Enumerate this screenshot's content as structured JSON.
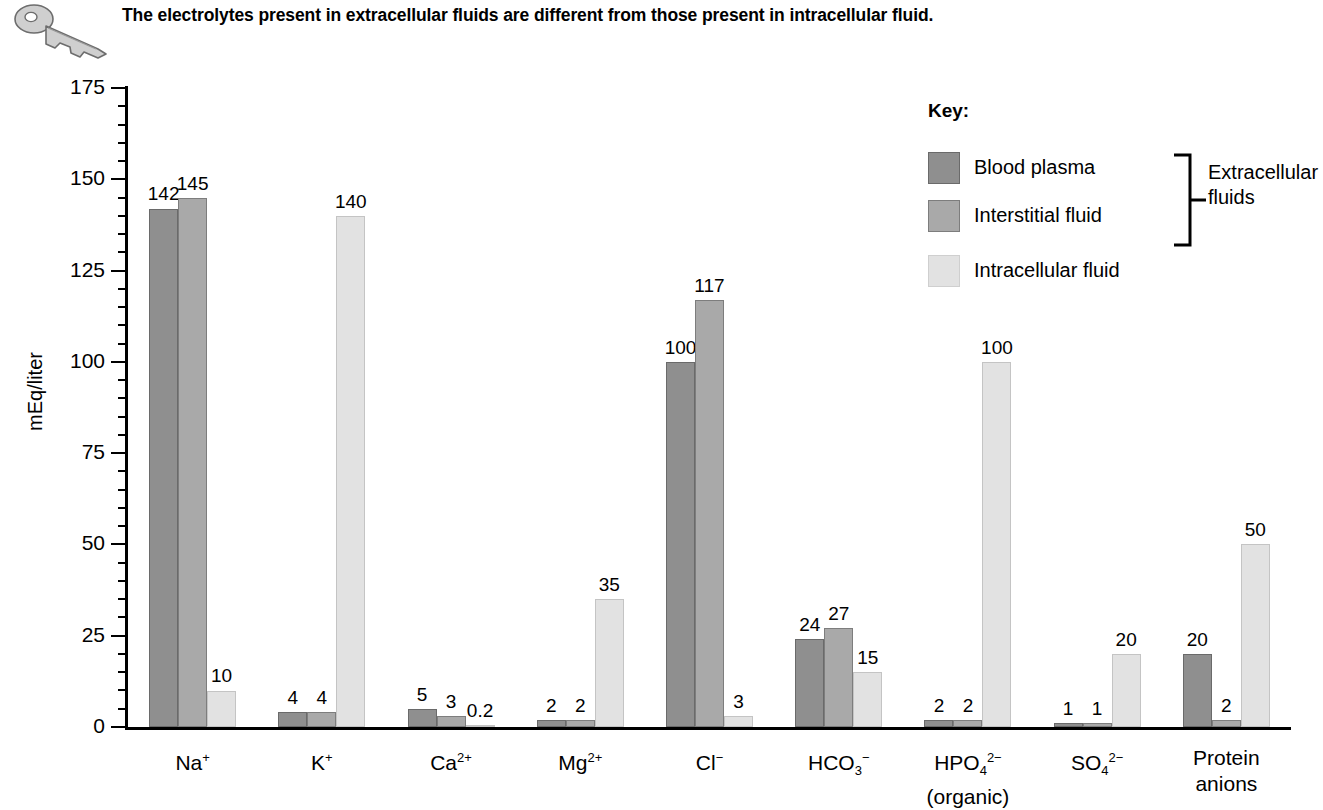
{
  "caption": {
    "text": "The electrolytes present in extracellular fluids are different from those present in intracellular fluid.",
    "icon": "key-icon"
  },
  "chart_data": {
    "type": "bar",
    "title": "The electrolytes present in extracellular fluids are different from those present in intracellular fluid.",
    "xlabel": "",
    "ylabel": "mEq/liter",
    "ylim": [
      0,
      175
    ],
    "ytick_labels": [
      "0",
      "25",
      "50",
      "75",
      "100",
      "125",
      "150",
      "175"
    ],
    "ytick_values": [
      0,
      25,
      50,
      75,
      100,
      125,
      150,
      175
    ],
    "minor_tick_step": 5,
    "grid": false,
    "legend_position": "top-right",
    "categories": [
      "Na+",
      "K+",
      "Ca2+",
      "Mg2+",
      "Cl-",
      "HCO3-",
      "HPO4 2- (organic)",
      "SO4 2-",
      "Protein anions"
    ],
    "category_labels_html": [
      {
        "base": "Na",
        "sup": "+",
        "sub": "",
        "line2": ""
      },
      {
        "base": "K",
        "sup": "+",
        "sub": "",
        "line2": ""
      },
      {
        "base": "Ca",
        "sup": "2+",
        "sub": "",
        "line2": ""
      },
      {
        "base": "Mg",
        "sup": "2+",
        "sub": "",
        "line2": ""
      },
      {
        "base": "Cl",
        "sup": "−",
        "sub": "",
        "line2": ""
      },
      {
        "base": "HCO",
        "sup": "−",
        "sub": "3",
        "line2": ""
      },
      {
        "base": "HPO",
        "sup": "2−",
        "sub": "4",
        "line2": "(organic)"
      },
      {
        "base": "SO",
        "sup": "2−",
        "sub": "4",
        "line2": ""
      },
      {
        "base": "Protein",
        "sup": "",
        "sub": "",
        "line2": "anions"
      }
    ],
    "series": [
      {
        "name": "Blood plasma",
        "color": "#8f8f8f",
        "values": [
          142,
          4,
          5,
          2,
          100,
          24,
          2,
          1,
          20
        ],
        "labels": [
          "142",
          "4",
          "5",
          "2",
          "100",
          "24",
          "2",
          "1",
          "20"
        ]
      },
      {
        "name": "Interstitial fluid",
        "color": "#a9a9a9",
        "values": [
          145,
          4,
          3,
          2,
          117,
          27,
          2,
          1,
          2
        ],
        "labels": [
          "145",
          "4",
          "3",
          "2",
          "117",
          "27",
          "2",
          "1",
          "2"
        ]
      },
      {
        "name": "Intracellular fluid",
        "color": "#e2e2e2",
        "values": [
          10,
          140,
          0.2,
          35,
          3,
          15,
          100,
          20,
          50
        ],
        "labels": [
          "10",
          "140",
          "0.2",
          "35",
          "3",
          "15",
          "100",
          "20",
          "50"
        ]
      }
    ]
  },
  "legend": {
    "title": "Key:",
    "items": [
      {
        "label": "Blood plasma",
        "color": "#8f8f8f"
      },
      {
        "label": "Interstitial fluid",
        "color": "#a9a9a9"
      },
      {
        "label": "Intracellular fluid",
        "color": "#e2e2e2"
      }
    ],
    "bracket_label_line1": "Extracellular",
    "bracket_label_line2": "fluids"
  }
}
